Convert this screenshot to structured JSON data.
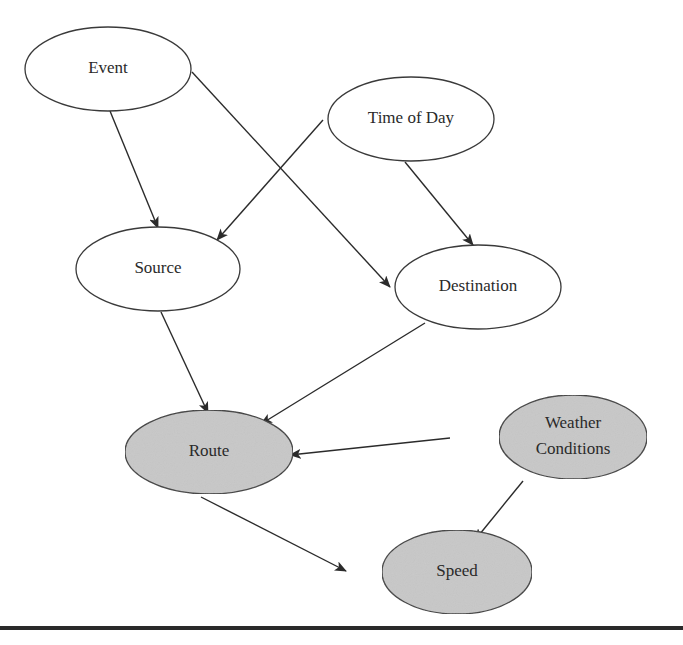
{
  "diagram": {
    "type": "directed-graph",
    "colors": {
      "plain_fill": "#ffffff",
      "shaded_fill": "#c8c8c8",
      "stroke": "#3a3a3a",
      "edge": "#2b2b2b"
    },
    "nodes": [
      {
        "id": "event",
        "label": "Event",
        "cx": 108,
        "cy": 69,
        "rx": 83,
        "ry": 42,
        "shaded": false
      },
      {
        "id": "time_of_day",
        "label": "Time of Day",
        "cx": 411,
        "cy": 119,
        "rx": 83,
        "ry": 42,
        "shaded": false
      },
      {
        "id": "source",
        "label": "Source",
        "cx": 158,
        "cy": 269,
        "rx": 82,
        "ry": 42,
        "shaded": false
      },
      {
        "id": "destination",
        "label": "Destination",
        "cx": 478,
        "cy": 287,
        "rx": 83,
        "ry": 42,
        "shaded": false
      },
      {
        "id": "route",
        "label": "Route",
        "cx": 209,
        "cy": 452,
        "rx": 84,
        "ry": 42,
        "shaded": true
      },
      {
        "id": "weather_conditions",
        "label": "Weather Conditions",
        "label_lines": [
          "Weather",
          "Conditions"
        ],
        "cx": 573,
        "cy": 437,
        "rx": 74,
        "ry": 42,
        "shaded": true
      },
      {
        "id": "speed",
        "label": "Speed",
        "cx": 457,
        "cy": 572,
        "rx": 75,
        "ry": 42,
        "shaded": true
      }
    ],
    "edges": [
      {
        "from": "event",
        "to": "source",
        "x1": 110,
        "y1": 111,
        "x2": 158,
        "y2": 228
      },
      {
        "from": "event",
        "to": "destination",
        "x1": 192,
        "y1": 72,
        "x2": 390,
        "y2": 287
      },
      {
        "from": "time_of_day",
        "to": "source",
        "x1": 323,
        "y1": 120,
        "x2": 217,
        "y2": 240
      },
      {
        "from": "time_of_day",
        "to": "destination",
        "x1": 405,
        "y1": 162,
        "x2": 473,
        "y2": 245
      },
      {
        "from": "source",
        "to": "route",
        "x1": 161,
        "y1": 312,
        "x2": 208,
        "y2": 413
      },
      {
        "from": "destination",
        "to": "route",
        "x1": 425,
        "y1": 323,
        "x2": 261,
        "y2": 424
      },
      {
        "from": "weather_conditions",
        "to": "route",
        "x1": 450,
        "y1": 438,
        "x2": 290,
        "y2": 455
      },
      {
        "from": "weather_conditions",
        "to": "speed",
        "x1": 523,
        "y1": 481,
        "x2": 475,
        "y2": 540
      },
      {
        "from": "route",
        "to": "speed",
        "x1": 201,
        "y1": 497,
        "x2": 346,
        "y2": 571
      }
    ]
  }
}
